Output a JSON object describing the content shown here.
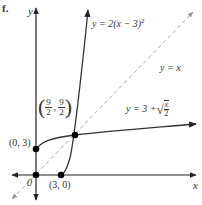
{
  "figure": {
    "label": "f.",
    "axes": {
      "x_label": "x",
      "y_label": "y",
      "origin_label": "0"
    },
    "curves": [
      {
        "name": "parabola",
        "equation": "y = 2(x − 3)²",
        "eq_prefix": "y = 2(x − 3)",
        "eq_sup": "2"
      },
      {
        "name": "identity",
        "equation": "y = x",
        "style": "dashed"
      },
      {
        "name": "sqrt",
        "equation": "y = 3 + √(x/2)",
        "eq_prefix": "y = 3 + ",
        "frac_num": "x",
        "frac_den": "2"
      }
    ],
    "points": [
      {
        "label": "(0, 3)",
        "x": 0,
        "y": 3
      },
      {
        "label": "(3, 0)",
        "x": 3,
        "y": 0
      },
      {
        "label_num_x": "9",
        "label_den_x": "2",
        "label_num_y": "9",
        "label_den_y": "2",
        "x": 4.5,
        "y": 4.5
      },
      {
        "label": "0",
        "x": 0,
        "y": 0
      }
    ],
    "colors": {
      "axis": "#222222",
      "curve": "#333333",
      "dashed": "#aaaaaa",
      "point": "#000000"
    }
  }
}
